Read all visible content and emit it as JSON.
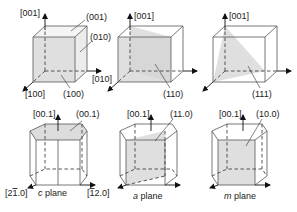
{
  "cubic": [
    {
      "id": "cube-001",
      "axis_z": "[001]",
      "axis_x": "[100]",
      "axis_y": "[010]",
      "planes": [
        "(001)",
        "(010)",
        "(100)"
      ]
    },
    {
      "id": "cube-110",
      "axis_z": "[001]",
      "plane": "(110)"
    },
    {
      "id": "cube-111",
      "axis_z": "[001]",
      "plane": "(111)"
    }
  ],
  "hexagonal": [
    {
      "id": "hex-c",
      "axis_c": "[00.1]",
      "plane": "(00.1)",
      "axis_a1": "[2̅1.0]",
      "axis_a2": "[̅1 2.0]",
      "caption_italic": "c",
      "caption": " plane"
    },
    {
      "id": "hex-a",
      "axis_c": "[00.1]",
      "plane": "(11.0)",
      "caption_italic": "a",
      "caption": " plane"
    },
    {
      "id": "hex-m",
      "axis_c": "[00.1]",
      "plane": "(10.0)",
      "caption_italic": "m",
      "caption": " plane"
    }
  ],
  "colors": {
    "plane_fill": "#d4d4d4",
    "edge": "#555555",
    "text": "#222222"
  }
}
